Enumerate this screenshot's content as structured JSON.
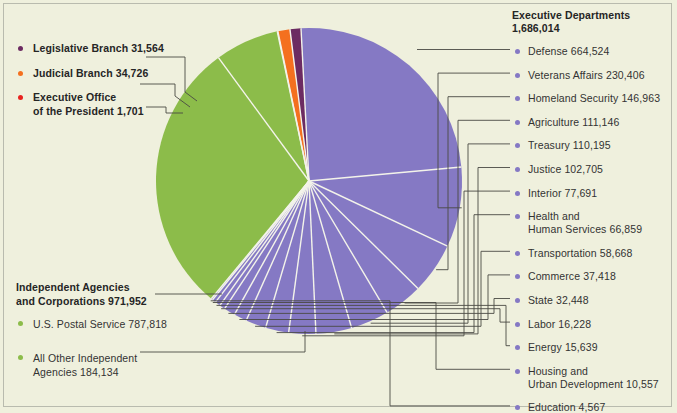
{
  "colors": {
    "background": "#eff0dd",
    "executive_departments": "#8579c4",
    "independent_agencies": "#8cbc4a",
    "legislative_branch": "#6c2b62",
    "judicial_branch": "#f4701f",
    "executive_office": "#e8231f",
    "leader_line": "#4a4a44",
    "text": "#2b2b2b"
  },
  "left_legend": {
    "items": [
      {
        "label": "Legislative Branch  31,564",
        "color_key": "legislative_branch"
      },
      {
        "label": "Judicial Branch  34,726",
        "color_key": "judicial_branch"
      },
      {
        "label": "Executive Office\nof the President  1,701",
        "line1": "Executive Office",
        "line2": "of the President  1,701",
        "color_key": "executive_office"
      }
    ]
  },
  "independent_block": {
    "title_line1": "Independent Agencies",
    "title_line2": "and Corporations 971,952",
    "items": [
      {
        "label": "U.S. Postal Service  787,818",
        "color_key": "independent_agencies"
      },
      {
        "line1": "All Other Independent",
        "line2": "Agencies  184,134",
        "color_key": "independent_agencies"
      }
    ]
  },
  "right_legend": {
    "title_line1": "Executive Departments",
    "title_line2": "1,686,014",
    "items": [
      {
        "label": "Defense  664,524"
      },
      {
        "label": "Veterans Affairs  230,406"
      },
      {
        "label": "Homeland Security  146,963"
      },
      {
        "label": "Agriculture  111,146"
      },
      {
        "label": "Treasury  110,195"
      },
      {
        "label": "Justice  102,705"
      },
      {
        "label": "Interior  77,691"
      },
      {
        "line1": "Health and",
        "line2": "Human Services  66,859"
      },
      {
        "label": "Transportation  58,668"
      },
      {
        "label": "Commerce  37,418"
      },
      {
        "label": "State  32,448"
      },
      {
        "label": "Labor  16,228"
      },
      {
        "label": "Energy  15,639"
      },
      {
        "line1": "Housing and",
        "line2": "Urban Development  10,557"
      },
      {
        "label": "Education  4,567"
      }
    ]
  },
  "chart_data": {
    "type": "pie",
    "center": {
      "x": 309,
      "y": 181
    },
    "radius": 153,
    "start_angle_deg": -93,
    "slices": [
      {
        "name": "Defense",
        "value": 664524,
        "group": "Executive Departments",
        "color": "#8579c4"
      },
      {
        "name": "Veterans Affairs",
        "value": 230406,
        "group": "Executive Departments",
        "color": "#8579c4"
      },
      {
        "name": "Homeland Security",
        "value": 146963,
        "group": "Executive Departments",
        "color": "#8579c4"
      },
      {
        "name": "Agriculture",
        "value": 111146,
        "group": "Executive Departments",
        "color": "#8579c4"
      },
      {
        "name": "Treasury",
        "value": 110195,
        "group": "Executive Departments",
        "color": "#8579c4"
      },
      {
        "name": "Justice",
        "value": 102705,
        "group": "Executive Departments",
        "color": "#8579c4"
      },
      {
        "name": "Interior",
        "value": 77691,
        "group": "Executive Departments",
        "color": "#8579c4"
      },
      {
        "name": "Health and Human Services",
        "value": 66859,
        "group": "Executive Departments",
        "color": "#8579c4"
      },
      {
        "name": "Transportation",
        "value": 58668,
        "group": "Executive Departments",
        "color": "#8579c4"
      },
      {
        "name": "Commerce",
        "value": 37418,
        "group": "Executive Departments",
        "color": "#8579c4"
      },
      {
        "name": "State",
        "value": 32448,
        "group": "Executive Departments",
        "color": "#8579c4"
      },
      {
        "name": "Labor",
        "value": 16228,
        "group": "Executive Departments",
        "color": "#8579c4"
      },
      {
        "name": "Energy",
        "value": 15639,
        "group": "Executive Departments",
        "color": "#8579c4"
      },
      {
        "name": "Housing and Urban Development",
        "value": 10557,
        "group": "Executive Departments",
        "color": "#8579c4"
      },
      {
        "name": "Education",
        "value": 4567,
        "group": "Executive Departments",
        "color": "#8579c4"
      },
      {
        "name": "U.S. Postal Service",
        "value": 787818,
        "group": "Independent Agencies and Corporations",
        "color": "#8cbc4a"
      },
      {
        "name": "All Other Independent Agencies",
        "value": 184134,
        "group": "Independent Agencies and Corporations",
        "color": "#8cbc4a"
      },
      {
        "name": "Executive Office of the President",
        "value": 1701,
        "group": "Executive Office of the President",
        "color": "#e8231f"
      },
      {
        "name": "Judicial Branch",
        "value": 34726,
        "group": "Judicial Branch",
        "color": "#f4701f"
      },
      {
        "name": "Legislative Branch",
        "value": 31564,
        "group": "Legislative Branch",
        "color": "#6c2b62"
      }
    ],
    "group_totals": {
      "Executive Departments": 1686014,
      "Independent Agencies and Corporations": 971952,
      "Judicial Branch": 34726,
      "Legislative Branch": 31564,
      "Executive Office of the President": 1701
    }
  }
}
